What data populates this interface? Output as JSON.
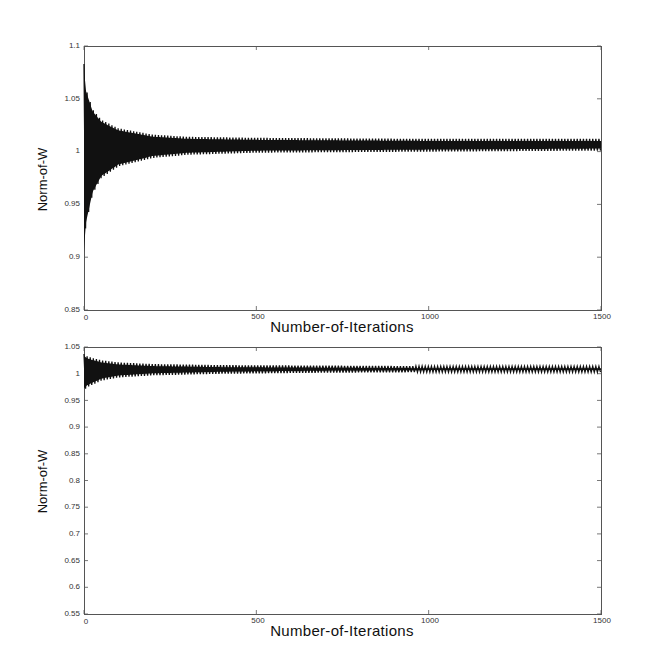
{
  "chart_data": [
    {
      "type": "line",
      "title": "",
      "xlabel": "Number-of-Iterations",
      "ylabel": "Norm-of-W",
      "xlim": [
        0,
        1500
      ],
      "ylim": [
        0.85,
        1.1
      ],
      "xticks": [
        0,
        500,
        1000,
        1500
      ],
      "xtick_labels": [
        "0",
        "500",
        "1000",
        "1500"
      ],
      "yticks": [
        0.85,
        0.9,
        0.95,
        1,
        1.05,
        1.1
      ],
      "ytick_labels": [
        "0.85",
        "0.9",
        "0.95",
        "1",
        "1.05",
        "1.1"
      ],
      "grid": false,
      "series": [
        {
          "name": "Norm-of-W (oscillating envelope)",
          "description": "Rapid oscillation; envelope decays from ~[0.903, 1.083] toward ~[1.000, 1.012]",
          "x": [
            0,
            5,
            25,
            50,
            100,
            200,
            300,
            500,
            1000,
            1500
          ],
          "upper": [
            1.083,
            1.06,
            1.04,
            1.03,
            1.022,
            1.016,
            1.014,
            1.013,
            1.012,
            1.012
          ],
          "lower": [
            0.903,
            0.93,
            0.96,
            0.975,
            0.986,
            0.994,
            0.997,
            0.999,
            1.0,
            1.001
          ]
        }
      ]
    },
    {
      "type": "line",
      "title": "",
      "xlabel": "Number-of-Iterations",
      "ylabel": "Norm-of-W",
      "xlim": [
        0,
        1500
      ],
      "ylim": [
        0.55,
        1.05
      ],
      "xticks": [
        0,
        500,
        1000,
        1500
      ],
      "xtick_labels": [
        "0",
        "500",
        "1000",
        "1500"
      ],
      "yticks": [
        0.55,
        0.6,
        0.65,
        0.7,
        0.75,
        0.8,
        0.85,
        0.9,
        0.95,
        1,
        1.05
      ],
      "ytick_labels": [
        "0.55",
        "0.6",
        "0.65",
        "0.7",
        "0.75",
        "0.8",
        "0.85",
        "0.9",
        "0.95",
        "1",
        "1.05"
      ],
      "grid": false,
      "series": [
        {
          "name": "Norm-of-W (oscillating envelope)",
          "description": "Rapid oscillation; envelope decays from ~[0.969, 1.037] toward ~[1.003, 1.013]",
          "x": [
            0,
            10,
            50,
            100,
            200,
            400,
            700,
            1000,
            1500
          ],
          "upper": [
            1.037,
            1.032,
            1.025,
            1.021,
            1.018,
            1.016,
            1.015,
            1.014,
            1.014
          ],
          "lower": [
            0.969,
            0.975,
            0.987,
            0.993,
            0.997,
            1.0,
            1.002,
            1.003,
            1.003
          ]
        }
      ]
    }
  ],
  "charts": {
    "top": {
      "xlabel": "Number-of-Iterations",
      "ylabel": "Norm-of-W",
      "xtick_labels": [
        "0",
        "500",
        "1000",
        "1500"
      ],
      "ytick_labels": [
        "0.85",
        "0.9",
        "0.95",
        "1",
        "1.05",
        "1.1"
      ]
    },
    "bottom": {
      "xlabel": "Number-of-Iterations",
      "ylabel": "Norm-of-W",
      "xtick_labels": [
        "0",
        "500",
        "1000",
        "1500"
      ],
      "ytick_labels": [
        "0.55",
        "0.6",
        "0.65",
        "0.7",
        "0.75",
        "0.8",
        "0.85",
        "0.9",
        "0.95",
        "1",
        "1.05"
      ]
    }
  },
  "colors": {
    "line": "#111111",
    "axes": "#555555",
    "background": "#ffffff"
  }
}
